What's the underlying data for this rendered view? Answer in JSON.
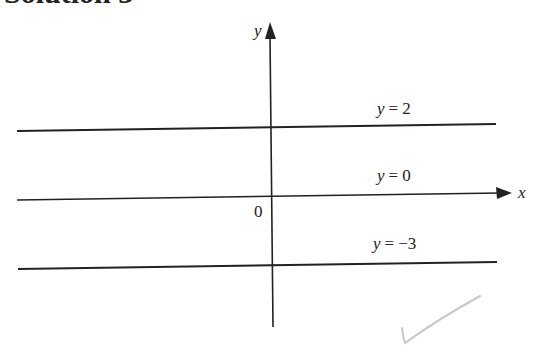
{
  "heading": "Solution 3",
  "figure": {
    "axes": {
      "x_label": "x",
      "y_label": "y",
      "origin_label": "0"
    },
    "lines": [
      {
        "label": "y = 2",
        "var": "y",
        "eq": "=",
        "value": "2"
      },
      {
        "label": "y = 0",
        "var": "y",
        "eq": "=",
        "value": "0"
      },
      {
        "label": "y = −3",
        "var": "y",
        "eq": "=",
        "value": "−3"
      }
    ],
    "annotations": {
      "check_mark": "check-mark-icon",
      "check_color": "#c8c8c8"
    },
    "colors": {
      "ink": "#222222",
      "background": "#ffffff"
    }
  }
}
